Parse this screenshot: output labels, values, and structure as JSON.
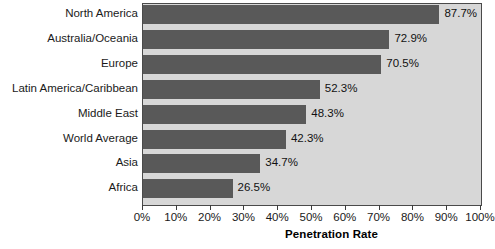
{
  "chart_data": {
    "type": "bar",
    "orientation": "horizontal",
    "title": "",
    "xlabel": "Penetration Rate",
    "ylabel": "",
    "xlim": [
      0,
      100
    ],
    "grid": false,
    "legend": null,
    "categories": [
      "North America",
      "Australia/Oceania",
      "Europe",
      "Latin America/Caribbean",
      "Middle East",
      "World Average",
      "Asia",
      "Africa"
    ],
    "values": [
      87.7,
      72.9,
      70.5,
      52.3,
      48.3,
      42.3,
      34.7,
      26.5
    ],
    "value_labels": [
      "87.7%",
      "72.9%",
      "70.5%",
      "52.3%",
      "48.3%",
      "42.3%",
      "34.7%",
      "26.5%"
    ],
    "xticks": [
      0,
      10,
      20,
      30,
      40,
      50,
      60,
      70,
      80,
      90,
      100
    ],
    "xtick_labels": [
      "0%",
      "10%",
      "20%",
      "30%",
      "40%",
      "50%",
      "60%",
      "70%",
      "80%",
      "90%",
      "100%"
    ],
    "colors": {
      "bar": "#595959",
      "plot_background": "#d7d7d7",
      "page_background": "#ffffff",
      "axis": "#4a4a4a",
      "text": "#1a1a1a"
    }
  }
}
